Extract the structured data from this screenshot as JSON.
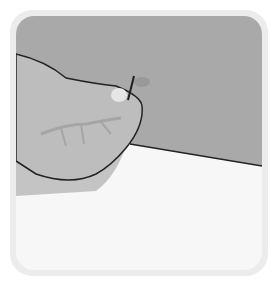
{
  "illustration": {
    "subject": "hand holding a pin against a surface",
    "colors": {
      "frame": "#ececec",
      "background": "#f7f7f7",
      "wall": "#a9a9a9",
      "hand": "#bdbdbd",
      "shadow": "#c9c9c9",
      "outline": "#222222"
    }
  }
}
